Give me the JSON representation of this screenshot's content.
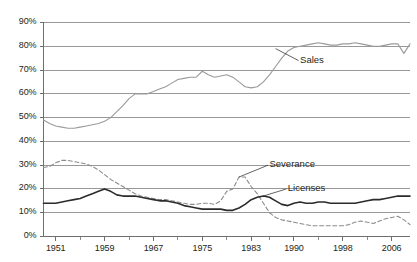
{
  "chart_data": {
    "type": "line",
    "title": "",
    "subtitle": "",
    "xlabel": "",
    "ylabel": "",
    "xlim": [
      1949,
      2009
    ],
    "ylim": [
      0,
      90
    ],
    "grid": true,
    "grid_axis": "y",
    "legend_position": "inline-annotations",
    "y_ticks": [
      0,
      10,
      20,
      30,
      40,
      50,
      60,
      70,
      80,
      90
    ],
    "y_ticklabels": [
      "0%",
      "10%",
      "20%",
      "30%",
      "40%",
      "50%",
      "60%",
      "70%",
      "80%",
      "90%"
    ],
    "x_ticks": [
      1951,
      1959,
      1967,
      1975,
      1983,
      1990,
      1998,
      2006
    ],
    "x_ticklabels": [
      "1951",
      "1959",
      "1967",
      "1975",
      "1983",
      "1990",
      "1998",
      "2006"
    ],
    "x_minor_ticks": [
      1955,
      1963,
      1971,
      1979,
      1986,
      1994,
      2002
    ],
    "annotations": [
      {
        "text": "Sales",
        "x": 1991,
        "y": 74,
        "leader_to_x": 1987,
        "leader_to_y": 79
      },
      {
        "text": "Severance",
        "x": 1986,
        "y": 30,
        "leader_to_x": 1981,
        "leader_to_y": 25
      },
      {
        "text": "Licenses",
        "x": 1989,
        "y": 20,
        "leader_to_x": 1985,
        "leader_to_y": 17
      }
    ],
    "series": [
      {
        "name": "Sales",
        "style": "solid",
        "color": "#9a9a9a",
        "width": 1.1,
        "x": [
          1949,
          1950,
          1951,
          1952,
          1953,
          1954,
          1955,
          1956,
          1957,
          1958,
          1959,
          1960,
          1961,
          1962,
          1963,
          1964,
          1965,
          1966,
          1967,
          1968,
          1969,
          1970,
          1971,
          1972,
          1973,
          1974,
          1975,
          1976,
          1977,
          1978,
          1979,
          1980,
          1981,
          1982,
          1983,
          1984,
          1985,
          1986,
          1987,
          1988,
          1989,
          1990,
          1991,
          1992,
          1993,
          1994,
          1995,
          1996,
          1997,
          1998,
          1999,
          2000,
          2001,
          2002,
          2003,
          2004,
          2005,
          2006,
          2007,
          2008,
          2009
        ],
        "values": [
          49,
          47.5,
          46.5,
          46,
          45.5,
          45.5,
          46,
          46.5,
          47,
          47.5,
          48.5,
          50,
          52.5,
          55,
          58,
          60,
          60,
          60,
          61,
          62,
          63,
          64.5,
          66,
          66.5,
          67,
          67,
          69.5,
          68,
          67,
          67.5,
          68,
          67,
          65,
          63,
          62.5,
          63,
          65,
          68,
          71.5,
          75,
          78,
          79.5,
          80,
          80.5,
          81,
          81.5,
          81,
          80.5,
          80.5,
          81,
          81,
          81.5,
          81,
          80.5,
          80,
          80,
          80.5,
          81,
          81,
          77,
          81
        ]
      },
      {
        "name": "Severance",
        "style": "dashed",
        "color": "#8c8c8c",
        "width": 1.1,
        "x": [
          1949,
          1950,
          1951,
          1952,
          1953,
          1954,
          1955,
          1956,
          1957,
          1958,
          1959,
          1960,
          1961,
          1962,
          1963,
          1964,
          1965,
          1966,
          1967,
          1968,
          1969,
          1970,
          1971,
          1972,
          1973,
          1974,
          1975,
          1976,
          1977,
          1978,
          1979,
          1980,
          1981,
          1982,
          1983,
          1984,
          1985,
          1986,
          1987,
          1988,
          1989,
          1990,
          1991,
          1992,
          1993,
          1994,
          1995,
          1996,
          1997,
          1998,
          1999,
          2000,
          2001,
          2002,
          2003,
          2004,
          2005,
          2006,
          2007,
          2008,
          2009
        ],
        "values": [
          29,
          29.5,
          31,
          32,
          32,
          31.5,
          31,
          30.5,
          29.5,
          28,
          26,
          24,
          22.5,
          21,
          19.5,
          18,
          17,
          16.5,
          16,
          15.5,
          15.5,
          15,
          14.5,
          14,
          13.5,
          13.5,
          14,
          14,
          13.5,
          15,
          19,
          20,
          25,
          25,
          21,
          18,
          14,
          10,
          8,
          7,
          6.5,
          6,
          5.5,
          5,
          4.5,
          4.5,
          4.5,
          4.5,
          4.5,
          4.5,
          5,
          6,
          6.5,
          6,
          5.5,
          6.5,
          7.5,
          8,
          8.5,
          7,
          5
        ]
      },
      {
        "name": "Licenses",
        "style": "solid",
        "color": "#2b2b2b",
        "width": 1.6,
        "x": [
          1949,
          1950,
          1951,
          1952,
          1953,
          1954,
          1955,
          1956,
          1957,
          1958,
          1959,
          1960,
          1961,
          1962,
          1963,
          1964,
          1965,
          1966,
          1967,
          1968,
          1969,
          1970,
          1971,
          1972,
          1973,
          1974,
          1975,
          1976,
          1977,
          1978,
          1979,
          1980,
          1981,
          1982,
          1983,
          1984,
          1985,
          1986,
          1987,
          1988,
          1989,
          1990,
          1991,
          1992,
          1993,
          1994,
          1995,
          1996,
          1997,
          1998,
          1999,
          2000,
          2001,
          2002,
          2003,
          2004,
          2005,
          2006,
          2007,
          2008,
          2009
        ],
        "values": [
          14,
          14,
          14,
          14.5,
          15,
          15.5,
          16,
          17,
          18,
          19,
          20,
          19,
          17.5,
          17,
          17,
          17,
          16.5,
          16,
          15.5,
          15,
          15,
          14.5,
          14,
          13,
          12.5,
          12,
          11.5,
          11.5,
          11.5,
          11.5,
          11,
          11,
          12,
          13.5,
          15.5,
          16.5,
          17,
          16.5,
          15,
          13.5,
          13,
          14,
          14.5,
          14,
          14,
          14.5,
          14.5,
          14,
          14,
          14,
          14,
          14,
          14.5,
          15,
          15.5,
          15.5,
          16,
          16.5,
          17,
          17,
          17
        ]
      }
    ]
  },
  "axis": {
    "y_labels": [
      "90%",
      "80%",
      "70%",
      "60%",
      "50%",
      "40%",
      "30%",
      "20%",
      "10%",
      "0%"
    ],
    "x_labels": [
      "1951",
      "1959",
      "1967",
      "1975",
      "1983",
      "1990",
      "1998",
      "2006"
    ]
  },
  "labels": {
    "sales": "Sales",
    "severance": "Severance",
    "licenses": "Licenses"
  },
  "colors": {
    "sales_line": "#9a9a9a",
    "severance_line": "#8c8c8c",
    "licenses_line": "#2b2b2b",
    "grid": "#8d8d8d",
    "axis": "#6e6e6e",
    "text": "#231f20",
    "background": "#ffffff"
  }
}
